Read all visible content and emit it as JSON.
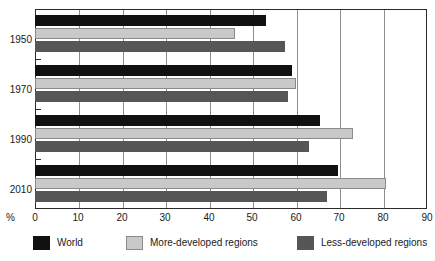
{
  "chart_data": {
    "type": "bar",
    "orientation": "horizontal",
    "title": "",
    "xlabel": "%",
    "ylabel": "",
    "xlim": [
      0,
      90
    ],
    "xticks": [
      0,
      10,
      20,
      30,
      40,
      50,
      60,
      70,
      80,
      90
    ],
    "grid": true,
    "grid_axis": "x",
    "legend_position": "bottom",
    "categories": [
      "1950",
      "1970",
      "1990",
      "2010"
    ],
    "series": [
      {
        "name": "World",
        "color": "#111111",
        "values": [
          53,
          59,
          65.5,
          69.5
        ]
      },
      {
        "name": "More-developed regions",
        "color": "#c9c9c9",
        "values": [
          46,
          60,
          73,
          80.5
        ]
      },
      {
        "name": "Less-developed regions",
        "color": "#565656",
        "values": [
          57.5,
          58,
          63,
          67
        ]
      }
    ]
  },
  "axis": {
    "unit_label": "%",
    "tick_labels": [
      "0",
      "10",
      "20",
      "30",
      "40",
      "50",
      "60",
      "70",
      "80",
      "90"
    ],
    "category_labels": [
      "1950",
      "1970",
      "1990",
      "2010"
    ]
  },
  "legend": {
    "items": [
      {
        "label": "World",
        "swatch": "world"
      },
      {
        "label": "More-developed regions",
        "swatch": "more"
      },
      {
        "label": "Less-developed regions",
        "swatch": "less"
      }
    ]
  },
  "colors": {
    "world": "#111111",
    "more_developed": "#c9c9c9",
    "less_developed": "#565656",
    "axis": "#2b2b2b",
    "grid": "#8d8d8d"
  }
}
